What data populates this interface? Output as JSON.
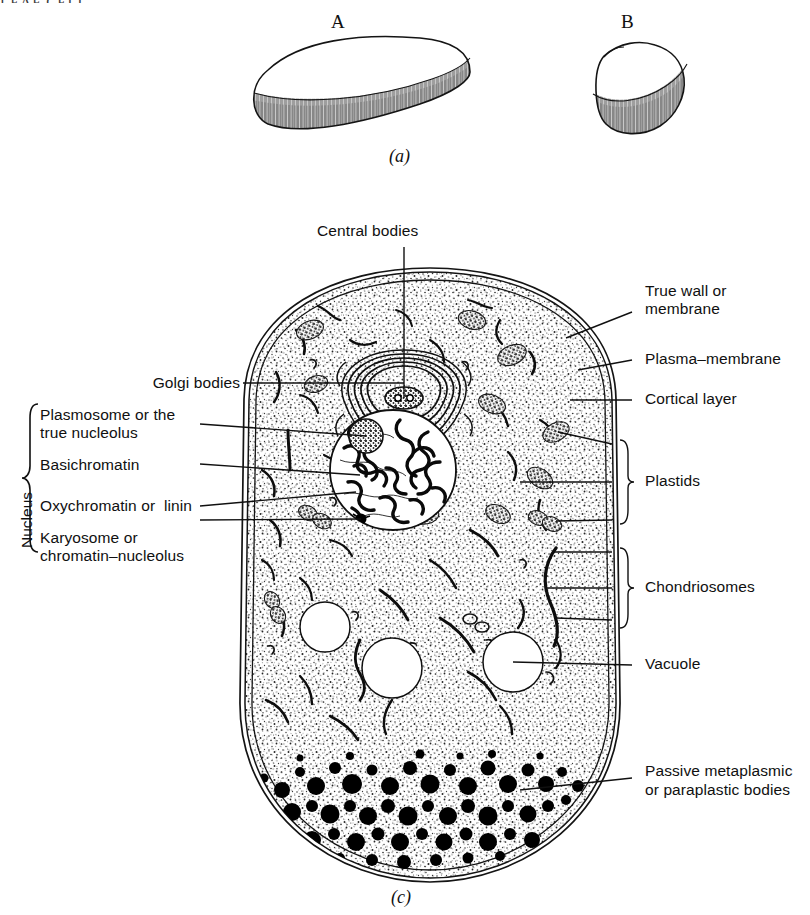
{
  "figure": {
    "cut_text_top": "LEAF CELL",
    "panel_a": {
      "caption": "(a)",
      "specimens": [
        {
          "id": "A",
          "label": "A"
        },
        {
          "id": "B",
          "label": "B"
        }
      ]
    },
    "panel_c": {
      "caption": "(c)"
    }
  },
  "labels": {
    "central_bodies": "Central bodies",
    "golgi_bodies": "Golgi bodies",
    "true_wall_line1": "True wall or",
    "true_wall_line2": "membrane",
    "plasma_membrane": "Plasma–membrane",
    "cortical_layer": "Cortical layer",
    "plastids": "Plastids",
    "chondriosomes": "Chondriosomes",
    "vacuole": "Vacuole",
    "passive_line1": "Passive metaplasmic",
    "passive_line2": "or paraplastic bodies",
    "nucleus_group": "Nucleus",
    "plasmosome_line1": "Plasmosome or the",
    "plasmosome_line2": "true nucleolus",
    "basichromatin": "Basichromatin",
    "oxychromatin": "Oxychromatin or  linin",
    "karyosome_line1": "Karyosome or",
    "karyosome_line2": "chromatin–nucleolus"
  },
  "colors": {
    "ink": "#101010",
    "line": "#1a1a1a",
    "stipple": "#2a2a2a",
    "paper": "#ffffff",
    "plastid_fill": "#8d8d8d",
    "granule": "#000000"
  },
  "structures": {
    "vacuoles": [
      {
        "name": "vacuole-left",
        "cx": 325,
        "cy": 627,
        "r": 25
      },
      {
        "name": "vacuole-middle",
        "cx": 392,
        "cy": 668,
        "r": 30
      },
      {
        "name": "vacuole-right",
        "cx": 513,
        "cy": 662,
        "r": 30
      }
    ],
    "nucleus": {
      "cx": 393,
      "cy": 470,
      "rx": 63,
      "ry": 60
    },
    "nucleolus": {
      "cx": 366,
      "cy": 436,
      "r": 17
    },
    "karyosome": {
      "cx": 361,
      "cy": 519,
      "r": 5
    },
    "centrosome": {
      "cx": 404,
      "cy": 398,
      "rx": 18,
      "ry": 10
    }
  }
}
